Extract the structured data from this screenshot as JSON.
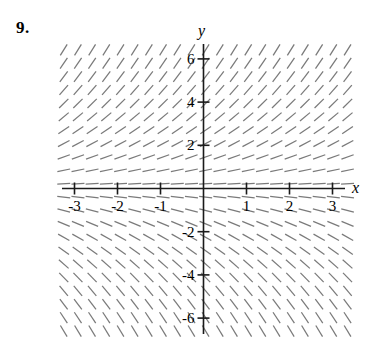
{
  "figure": {
    "problem_number": "9.",
    "axis_labels": {
      "x": "x",
      "y": "y"
    },
    "colors": {
      "axis": "#1a1a1a",
      "field": "#7a7a7a",
      "background": "#ffffff",
      "text": "#000000"
    }
  },
  "chart_data": {
    "type": "scatter",
    "title": "",
    "subtitle": "",
    "xlabel": "x",
    "ylabel": "y",
    "xlim": [
      -3.5,
      3.5
    ],
    "ylim": [
      -7,
      7
    ],
    "grid": false,
    "legend": null,
    "plot_kind": "direction-field",
    "slope_rule": "dy/dx proportional to y",
    "x_ticks": [
      -3,
      -2,
      -1,
      1,
      2,
      3
    ],
    "x_tick_labels": [
      "-3",
      "-2",
      "-1",
      "1",
      "2",
      "3"
    ],
    "y_ticks": [
      6,
      4,
      2,
      -2,
      -4,
      -6
    ],
    "y_tick_labels": [
      "6",
      "4",
      "2",
      "-2",
      "-4",
      "-6"
    ],
    "field": {
      "x_start": -3.25,
      "x_end": 3.4,
      "x_step": 0.33,
      "y_start": -6.6,
      "y_end": 6.6,
      "y_step": 0.62,
      "segment_length_px": 13
    },
    "sample_slopes": [
      {
        "x": 0,
        "y": 6,
        "slope": 3.0
      },
      {
        "x": 0,
        "y": 4,
        "slope": 2.0
      },
      {
        "x": 0,
        "y": 2,
        "slope": 1.0
      },
      {
        "x": 0,
        "y": 1,
        "slope": 0.5
      },
      {
        "x": 0,
        "y": 0,
        "slope": 0.0
      },
      {
        "x": 0,
        "y": -1,
        "slope": -0.5
      },
      {
        "x": 0,
        "y": -2,
        "slope": -1.0
      },
      {
        "x": 0,
        "y": -4,
        "slope": -2.0
      },
      {
        "x": 0,
        "y": -6,
        "slope": -3.0
      }
    ]
  }
}
